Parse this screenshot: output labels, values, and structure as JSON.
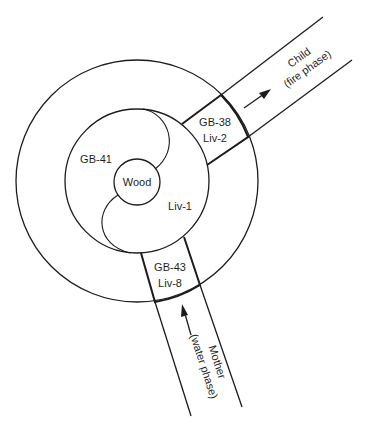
{
  "diagram": {
    "title": "",
    "center_label": "Wood",
    "inner_ring": {
      "upper_left_label": "GB-41",
      "lower_right_label": "Liv-1"
    },
    "fire_gate": {
      "line1": "GB-38",
      "line2": "Liv-2"
    },
    "water_gate": {
      "line1": "GB-43",
      "line2": "Liv-8"
    },
    "child_channel": {
      "line1": "Child",
      "line2": "(fire phase)",
      "arrow_direction": "outward"
    },
    "mother_channel": {
      "line1": "Mother",
      "line2": "(water phase)",
      "arrow_direction": "inward"
    },
    "colors": {
      "stroke": "#1c1c1c",
      "text": "#1f1f1f",
      "background": "#ffffff"
    }
  }
}
